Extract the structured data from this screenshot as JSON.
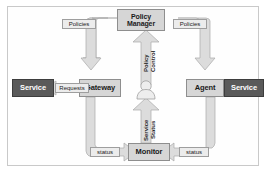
{
  "diagram": {
    "background": "#ffffff",
    "border_color": "#c9c9c9",
    "node_light_fill": "#d6d6d6",
    "node_dark_fill": "#5a5a5a",
    "arrow_fill": "#dcdcdc",
    "arrow_stroke": "#a8a8a8",
    "label_fill": "#ececec"
  },
  "nodes": {
    "policy_manager": "Policy\nManager",
    "policy_manager_line1": "Policy",
    "policy_manager_line2": "Manager",
    "gateway": "Gateway",
    "agent": "Agent",
    "monitor": "Monitor",
    "service_left": "Service",
    "service_right": "Service",
    "user": "user-figure"
  },
  "edge_labels": {
    "policies_left": "Policies",
    "policies_right": "Policies",
    "requests": "Requests",
    "status_left": "status",
    "status_right": "status",
    "policy_control": "Policy Control",
    "policy_control_line1": "Policy",
    "policy_control_line2": "Control",
    "service_status": "Service Status",
    "service_status_line1": "Service",
    "service_status_line2": "Status"
  }
}
